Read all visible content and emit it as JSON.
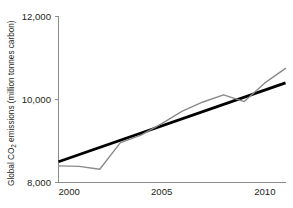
{
  "chart_data": {
    "type": "line",
    "title": "",
    "xlabel": "",
    "ylabel": "Global CO2 emissions (million tonnes carbon)",
    "ylabel_parts": {
      "prefix": "Global CO",
      "subscript": "2",
      "suffix": " emissions (million tonnes carbon)"
    },
    "xlim": [
      2000,
      2011
    ],
    "ylim": [
      8000,
      12000
    ],
    "grid": false,
    "legend": "none",
    "x_ticks": [
      2000,
      2005,
      2010
    ],
    "x_tick_labels": [
      "2000",
      "2005",
      "2010"
    ],
    "y_ticks": [
      8000,
      10000,
      12000
    ],
    "y_tick_labels": [
      "8,000",
      "10,000",
      "12,000"
    ],
    "x": [
      2000,
      2001,
      2002,
      2003,
      2004,
      2005,
      2006,
      2007,
      2008,
      2009,
      2010,
      2011
    ],
    "series": [
      {
        "name": "Global CO2 emissions",
        "color": "#8a8a8a",
        "style": "observed-data",
        "values": [
          8400,
          8390,
          8320,
          8960,
          9140,
          9420,
          9720,
          9940,
          10110,
          9950,
          10400,
          10750
        ]
      },
      {
        "name": "Linear trend",
        "color": "#000000",
        "style": "trend-line",
        "x": [
          2000,
          2011
        ],
        "values": [
          8500,
          10400
        ]
      }
    ]
  },
  "figure": {
    "background_color": "#ffffff",
    "axis_color": "#8c8c8c",
    "text_color": "#231f20"
  }
}
